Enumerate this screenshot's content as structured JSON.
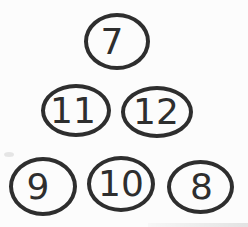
{
  "figure": {
    "type": "number-bubbles",
    "stroke_color": "#2e2e2e",
    "text_color": "#2e2e2e",
    "background": "#fcfcfc",
    "rows": [
      {
        "nodes": [
          {
            "label": "7"
          }
        ]
      },
      {
        "nodes": [
          {
            "label": "11"
          },
          {
            "label": "12"
          }
        ]
      },
      {
        "nodes": [
          {
            "label": "9"
          },
          {
            "label": "10"
          },
          {
            "label": "8"
          }
        ]
      }
    ]
  }
}
